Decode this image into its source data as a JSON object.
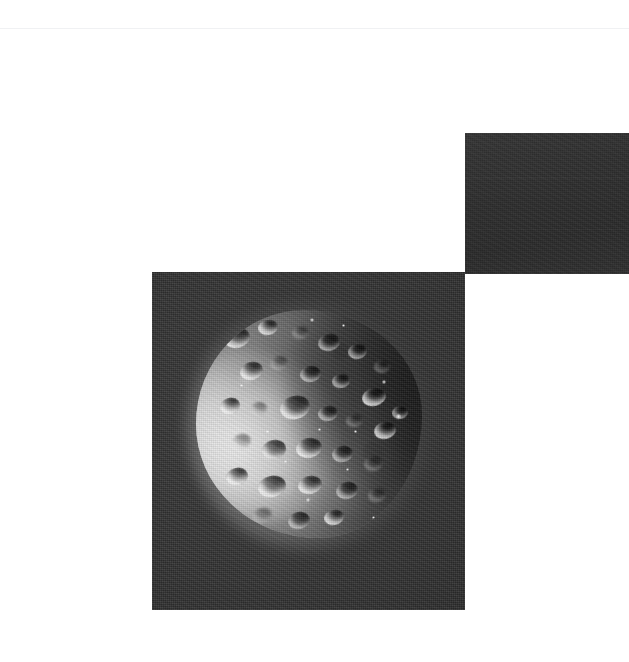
{
  "page": {
    "background_color": "#ffffff",
    "width": 629,
    "height": 662,
    "rule_color": "#f0f1f3"
  },
  "plates": [
    {
      "id": "plate-topright",
      "name": "dark-swatch-plate",
      "caption": "",
      "background_color": "#2d2d2d",
      "x": 465,
      "y": 133,
      "width": 164,
      "height": 141,
      "content": "blank dark exposure swatch"
    },
    {
      "id": "plate-moon",
      "name": "moon-photograph-plate",
      "caption": "",
      "background_color": "#303030",
      "x": 152,
      "y": 272,
      "width": 313,
      "height": 338,
      "content": "grayscale photograph of a heavily cratered moon"
    }
  ],
  "photo": {
    "subject": "cratered icy moon",
    "rendering": "grayscale",
    "illumination": "sunlight from lower-left; terminator across upper-right",
    "limb_highlight_color": "#f3f3f3",
    "shadow_color": "#3e3e3e",
    "sky_color": "#2c2c2c",
    "disc_center_x": 309,
    "disc_center_y": 425,
    "disc_radius": 113
  },
  "craters": [
    {
      "x": 28,
      "y": 18,
      "w": 26,
      "h": 20,
      "r": -14,
      "style": "bright"
    },
    {
      "x": 62,
      "y": 10,
      "w": 20,
      "h": 15,
      "r": -8,
      "style": "bright"
    },
    {
      "x": 96,
      "y": 16,
      "w": 17,
      "h": 13,
      "r": -6,
      "style": "faint"
    },
    {
      "x": 122,
      "y": 24,
      "w": 22,
      "h": 17,
      "r": -12,
      "style": "normal"
    },
    {
      "x": 152,
      "y": 34,
      "w": 19,
      "h": 15,
      "r": -10,
      "style": "normal"
    },
    {
      "x": 178,
      "y": 50,
      "w": 16,
      "h": 13,
      "r": -8,
      "style": "faint"
    },
    {
      "x": 44,
      "y": 52,
      "w": 23,
      "h": 18,
      "r": -16,
      "style": "bright"
    },
    {
      "x": 74,
      "y": 46,
      "w": 18,
      "h": 14,
      "r": -10,
      "style": "faint"
    },
    {
      "x": 104,
      "y": 56,
      "w": 21,
      "h": 16,
      "r": -10,
      "style": "normal"
    },
    {
      "x": 136,
      "y": 64,
      "w": 18,
      "h": 14,
      "r": -8,
      "style": "normal"
    },
    {
      "x": 166,
      "y": 78,
      "w": 24,
      "h": 18,
      "r": -14,
      "style": "bright"
    },
    {
      "x": 24,
      "y": 88,
      "w": 20,
      "h": 16,
      "r": -18,
      "style": "bright"
    },
    {
      "x": 54,
      "y": 92,
      "w": 17,
      "h": 13,
      "r": -10,
      "style": "faint"
    },
    {
      "x": 84,
      "y": 86,
      "w": 30,
      "h": 23,
      "r": -14,
      "style": "bright"
    },
    {
      "x": 122,
      "y": 96,
      "w": 20,
      "h": 15,
      "r": -8,
      "style": "normal"
    },
    {
      "x": 150,
      "y": 104,
      "w": 17,
      "h": 13,
      "r": -8,
      "style": "faint"
    },
    {
      "x": 178,
      "y": 112,
      "w": 22,
      "h": 17,
      "r": -12,
      "style": "bright"
    },
    {
      "x": 36,
      "y": 124,
      "w": 19,
      "h": 15,
      "r": -14,
      "style": "faint"
    },
    {
      "x": 66,
      "y": 130,
      "w": 24,
      "h": 19,
      "r": -12,
      "style": "normal"
    },
    {
      "x": 100,
      "y": 128,
      "w": 26,
      "h": 20,
      "r": -10,
      "style": "bright"
    },
    {
      "x": 136,
      "y": 136,
      "w": 21,
      "h": 16,
      "r": -10,
      "style": "normal"
    },
    {
      "x": 168,
      "y": 146,
      "w": 19,
      "h": 15,
      "r": -12,
      "style": "faint"
    },
    {
      "x": 30,
      "y": 158,
      "w": 22,
      "h": 17,
      "r": -16,
      "style": "bright"
    },
    {
      "x": 62,
      "y": 166,
      "w": 28,
      "h": 21,
      "r": -14,
      "style": "bright"
    },
    {
      "x": 102,
      "y": 166,
      "w": 24,
      "h": 18,
      "r": -12,
      "style": "bright"
    },
    {
      "x": 140,
      "y": 172,
      "w": 22,
      "h": 17,
      "r": -10,
      "style": "normal"
    },
    {
      "x": 172,
      "y": 178,
      "w": 18,
      "h": 14,
      "r": -10,
      "style": "faint"
    },
    {
      "x": 56,
      "y": 198,
      "w": 20,
      "h": 15,
      "r": -14,
      "style": "faint"
    },
    {
      "x": 92,
      "y": 202,
      "w": 22,
      "h": 17,
      "r": -12,
      "style": "normal"
    },
    {
      "x": 128,
      "y": 200,
      "w": 20,
      "h": 15,
      "r": -10,
      "style": "bright"
    },
    {
      "x": 196,
      "y": 96,
      "w": 16,
      "h": 13,
      "r": -8,
      "style": "normal"
    }
  ],
  "specks": [
    {
      "x": 114,
      "y": 8,
      "s": 4
    },
    {
      "x": 146,
      "y": 14,
      "s": 3
    },
    {
      "x": 186,
      "y": 70,
      "s": 4
    },
    {
      "x": 200,
      "y": 104,
      "s": 5
    },
    {
      "x": 158,
      "y": 120,
      "s": 3
    },
    {
      "x": 122,
      "y": 118,
      "s": 3
    },
    {
      "x": 88,
      "y": 150,
      "s": 3
    },
    {
      "x": 110,
      "y": 188,
      "s": 4
    },
    {
      "x": 150,
      "y": 158,
      "s": 3
    },
    {
      "x": 70,
      "y": 120,
      "s": 3
    },
    {
      "x": 44,
      "y": 74,
      "s": 3
    },
    {
      "x": 176,
      "y": 206,
      "s": 3
    }
  ],
  "swatch_bands": [
    {
      "top": 44,
      "height": 2
    },
    {
      "top": 96,
      "height": 1
    }
  ]
}
